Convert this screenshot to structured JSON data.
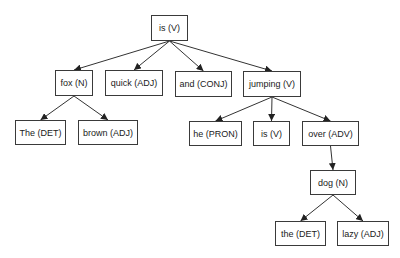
{
  "diagram": {
    "type": "dependency-parse-tree",
    "nodes": [
      {
        "id": "is_root",
        "label": "is (V)",
        "x": 151,
        "y": 15,
        "w": 37,
        "h": 26
      },
      {
        "id": "fox",
        "label": "fox (N)",
        "x": 55,
        "y": 70,
        "w": 38,
        "h": 26
      },
      {
        "id": "quick",
        "label": "quick (ADJ)",
        "x": 105,
        "y": 70,
        "w": 58,
        "h": 26
      },
      {
        "id": "and",
        "label": "and (CONJ)",
        "x": 175,
        "y": 71,
        "w": 57,
        "h": 26
      },
      {
        "id": "jumping",
        "label": "jumping (V)",
        "x": 243,
        "y": 71,
        "w": 58,
        "h": 26
      },
      {
        "id": "the1",
        "label": "The (DET)",
        "x": 15,
        "y": 120,
        "w": 51,
        "h": 25
      },
      {
        "id": "brown",
        "label": "brown (ADJ)",
        "x": 78,
        "y": 120,
        "w": 60,
        "h": 25
      },
      {
        "id": "he",
        "label": "he (PRON)",
        "x": 189,
        "y": 121,
        "w": 53,
        "h": 25
      },
      {
        "id": "is2",
        "label": "is (V)",
        "x": 253,
        "y": 121,
        "w": 37,
        "h": 25
      },
      {
        "id": "over",
        "label": "over (ADV)",
        "x": 302,
        "y": 121,
        "w": 57,
        "h": 25
      },
      {
        "id": "dog",
        "label": "dog (N)",
        "x": 310,
        "y": 170,
        "w": 46,
        "h": 25
      },
      {
        "id": "the2",
        "label": "the (DET)",
        "x": 275,
        "y": 221,
        "w": 51,
        "h": 25
      },
      {
        "id": "lazy",
        "label": "lazy (ADJ)",
        "x": 337,
        "y": 221,
        "w": 52,
        "h": 25
      }
    ],
    "edges": [
      {
        "from": "is_root",
        "to": "fox"
      },
      {
        "from": "is_root",
        "to": "quick"
      },
      {
        "from": "is_root",
        "to": "and"
      },
      {
        "from": "is_root",
        "to": "jumping"
      },
      {
        "from": "fox",
        "to": "the1"
      },
      {
        "from": "fox",
        "to": "brown"
      },
      {
        "from": "jumping",
        "to": "he"
      },
      {
        "from": "jumping",
        "to": "is2"
      },
      {
        "from": "jumping",
        "to": "over"
      },
      {
        "from": "over",
        "to": "dog"
      },
      {
        "from": "dog",
        "to": "the2"
      },
      {
        "from": "dog",
        "to": "lazy"
      }
    ],
    "colors": {
      "line": "#333333",
      "border": "#3a3a3a",
      "text": "#1a1a1a",
      "background": "#ffffff"
    }
  }
}
